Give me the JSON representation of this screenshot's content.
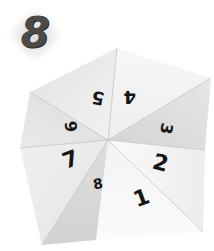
{
  "badge": {
    "label": "8"
  },
  "fortune_teller": {
    "flaps": [
      {
        "number": "1"
      },
      {
        "number": "2"
      },
      {
        "number": "3"
      },
      {
        "number": "4"
      },
      {
        "number": "5"
      },
      {
        "number": "6"
      },
      {
        "number": "7"
      },
      {
        "number": "8"
      }
    ]
  },
  "colors": {
    "paper": "#f4f4f4",
    "shadow": "#d6d6d6",
    "ink": "#151515",
    "badge": "#4a4a4a"
  }
}
